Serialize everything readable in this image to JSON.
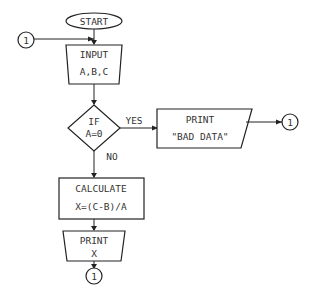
{
  "flowchart": {
    "start": {
      "label": "START"
    },
    "connector_in": {
      "label": "1"
    },
    "input": {
      "line1": "INPUT",
      "line2": "A,B,C"
    },
    "decision": {
      "line1": "IF",
      "line2": "A=0",
      "yes_label": "YES",
      "no_label": "NO"
    },
    "print_bad": {
      "line1": "PRINT",
      "line2": "\"BAD DATA\""
    },
    "connector_yes": {
      "label": "1"
    },
    "calculate": {
      "line1": "CALCULATE",
      "line2": "X=(C-B)/A"
    },
    "print_x": {
      "line1": "PRINT",
      "line2": "X"
    },
    "connector_end": {
      "label": "1"
    }
  }
}
